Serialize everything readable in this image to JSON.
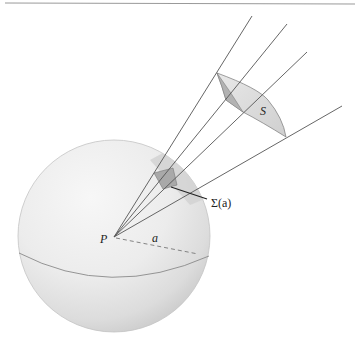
{
  "figure": {
    "labels": {
      "point": "P",
      "radius": "a",
      "far_surface": "S",
      "solid_angle_patch": "Σ(a)"
    },
    "colors": {
      "background": "#ffffff",
      "sphere_light": "#f4f4f4",
      "sphere_mid": "#dddddd",
      "sphere_edge": "#c6c6c6",
      "cone_shade": "#cfcfcf",
      "patch_fill": "#a8a8a8",
      "surface_fill": "#dcdcdc",
      "surface_fold": "#b4b4b4",
      "line": "#555555",
      "top_rule": "#9a9a9a"
    }
  }
}
